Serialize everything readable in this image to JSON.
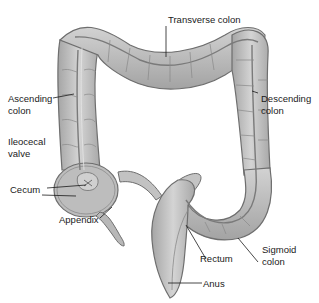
{
  "diagram": {
    "labels": {
      "transverse_colon": "Transverse colon",
      "ascending_colon_1": "Ascending",
      "ascending_colon_2": "colon",
      "descending_colon_1": "Descending",
      "descending_colon_2": "colon",
      "ileocecal_valve_1": "Ileocecal",
      "ileocecal_valve_2": "valve",
      "cecum": "Cecum",
      "appendix": "Appendix",
      "rectum": "Rectum",
      "sigmoid_colon_1": "Sigmoid",
      "sigmoid_colon_2": "colon",
      "anus": "Anus"
    },
    "colors": {
      "tissue_fill": "#b3b3b3",
      "tissue_light": "#d6d6d6",
      "tissue_outline": "#6e6e6e",
      "label_text": "#1a1a1a"
    }
  }
}
